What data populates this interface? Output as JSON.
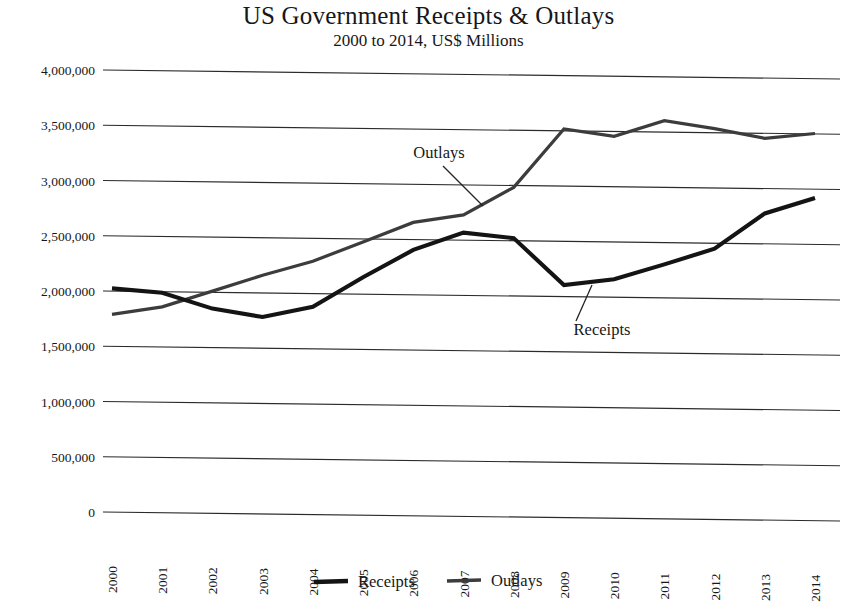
{
  "chart_data": {
    "type": "line",
    "title": "US Government Receipts & Outlays",
    "subtitle": "2000 to 2014, US$ Millions",
    "xlabel": "",
    "ylabel": "",
    "grid": true,
    "legend_position": "bottom",
    "ylim": [
      0,
      4000000
    ],
    "ytick_labels": [
      "4,000,000",
      "3,500,000",
      "3,000,000",
      "2,500,000",
      "2,000,000",
      "1,500,000",
      "1,000,000",
      "500,000",
      "0"
    ],
    "ytick_values": [
      4000000,
      3500000,
      3000000,
      2500000,
      2000000,
      1500000,
      1000000,
      500000,
      0
    ],
    "categories": [
      "2000",
      "2001",
      "2002",
      "2003",
      "2004",
      "2005",
      "2006",
      "2007",
      "2008",
      "2009",
      "2010",
      "2011",
      "2012",
      "2013",
      "2014"
    ],
    "series": [
      {
        "name": "Receipts",
        "color": "#141414",
        "values": [
          2025000,
          1991000,
          1853000,
          1782000,
          1880000,
          2153000,
          2406000,
          2568000,
          2524000,
          2105000,
          2163000,
          2303000,
          2450000,
          2775000,
          2921000
        ]
      },
      {
        "name": "Outlays",
        "color": "#3c3c3c",
        "values": [
          1789000,
          1863000,
          2011000,
          2160000,
          2293000,
          2472000,
          2655000,
          2729000,
          2983000,
          3518000,
          3457000,
          3603000,
          3537000,
          3455000,
          3504000
        ]
      }
    ],
    "annotations": [
      {
        "text": "Outlays",
        "series": "Outlays",
        "near_category": "2007"
      },
      {
        "text": "Receipts",
        "series": "Receipts",
        "near_category": "2010"
      }
    ]
  },
  "legend": {
    "items": [
      {
        "label": "Receipts"
      },
      {
        "label": "Outlays"
      }
    ]
  }
}
